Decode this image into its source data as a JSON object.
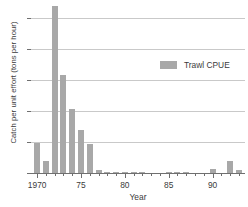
{
  "chart_data": {
    "type": "bar",
    "title": "",
    "subtitle": "",
    "xlabel": "Year",
    "ylabel": "Catch per unit effort (tons per hour)",
    "xlim": [
      1969.3,
      1993.7
    ],
    "ylim": [
      0,
      54.5
    ],
    "yticks": [
      0,
      10,
      20,
      30,
      40,
      50
    ],
    "ytick_labels": [
      "0",
      "10",
      "20",
      "30",
      "40",
      "50"
    ],
    "xticks": [
      1970,
      1975,
      1980,
      1985,
      1990
    ],
    "xtick_labels": [
      "1970",
      "75",
      "80",
      "85",
      "90"
    ],
    "xtick_minor": [
      1971,
      1972,
      1973,
      1974,
      1976,
      1977,
      1978,
      1979,
      1981,
      1982,
      1983,
      1984,
      1986,
      1987,
      1988,
      1989,
      1991,
      1992,
      1993
    ],
    "grid": "horizontal",
    "legend_position": "upper-right",
    "legend": [
      "Trawl CPUE"
    ],
    "series_color": "#a8a8a8",
    "axis_color": "#6f6f6f",
    "grid_color": "#c9c9c9",
    "categories": [
      1970,
      1971,
      1972,
      1973,
      1974,
      1975,
      1976,
      1977,
      1978,
      1979,
      1980,
      1981,
      1982,
      1983,
      1984,
      1985,
      1986,
      1987,
      1988,
      1989,
      1990,
      1991,
      1992,
      1993
    ],
    "series": [
      {
        "name": "Trawl CPUE",
        "values": [
          9.7,
          4.0,
          54.0,
          31.5,
          20.5,
          14.0,
          9.2,
          1.0,
          0.1,
          0.1,
          0.4,
          0.3,
          0.1,
          0.0,
          0.0,
          0.1,
          0.2,
          0.1,
          0.0,
          0.0,
          1.2,
          0.0,
          3.9,
          1.0
        ]
      }
    ]
  },
  "legend": {
    "entry_label": "Trawl CPUE"
  },
  "axes": {
    "y_title": "Catch per unit effort (tons per hour)",
    "x_title": "Year"
  }
}
